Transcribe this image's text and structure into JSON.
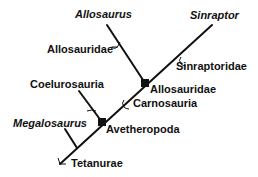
{
  "diagram": {
    "type": "cladogram",
    "colors": {
      "line": "#111111",
      "text": "#111111",
      "background": "#ffffff"
    },
    "taxa": [
      {
        "name": "Allosaurus",
        "italic": true
      },
      {
        "name": "Sinraptor",
        "italic": true
      },
      {
        "name": "Megalosaurus",
        "italic": true
      }
    ],
    "clades": [
      {
        "name": "Allosauridae",
        "kind": "stem"
      },
      {
        "name": "Sinraptoridae",
        "kind": "stem"
      },
      {
        "name": "Allosauridae",
        "kind": "node"
      },
      {
        "name": "Coelurosauria",
        "kind": "tip"
      },
      {
        "name": "Carnosauria",
        "kind": "stem"
      },
      {
        "name": "Avetheropoda",
        "kind": "node"
      },
      {
        "name": "Tetanurae",
        "kind": "stem"
      }
    ]
  }
}
